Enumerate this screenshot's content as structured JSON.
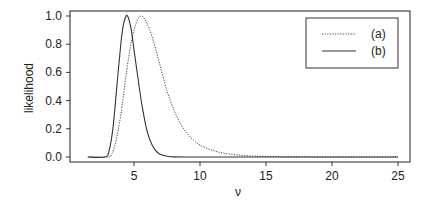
{
  "chart_data": {
    "type": "line",
    "title": "",
    "xlabel": "ν",
    "ylabel": "likelihood",
    "xlim": [
      0.7,
      25.9
    ],
    "ylim": [
      -0.04,
      1.04
    ],
    "xticks": [
      5,
      10,
      15,
      20,
      25
    ],
    "xtick_labels": [
      "5",
      "10",
      "15",
      "20",
      "25"
    ],
    "yticks": [
      0.0,
      0.2,
      0.4,
      0.6,
      0.8,
      1.0
    ],
    "ytick_labels": [
      "0.0",
      "0.2",
      "0.4",
      "0.6",
      "0.8",
      "1.0"
    ],
    "grid": false,
    "legend_position": "upper right",
    "series": [
      {
        "name": "(a)",
        "style": "dotted",
        "x": [
          1.5,
          3.0,
          3.3,
          3.6,
          4.0,
          4.4,
          4.8,
          5.2,
          5.5,
          5.8,
          6.2,
          6.6,
          7.0,
          7.5,
          8.0,
          8.5,
          9.0,
          9.5,
          10.0,
          11.0,
          12.0,
          13.0,
          14.0,
          15.0,
          16.0,
          18.0,
          20.0,
          22.0,
          25.0
        ],
        "values": [
          0.0,
          0.0,
          0.02,
          0.1,
          0.3,
          0.58,
          0.82,
          0.96,
          1.0,
          0.98,
          0.9,
          0.78,
          0.64,
          0.47,
          0.34,
          0.24,
          0.17,
          0.12,
          0.085,
          0.045,
          0.024,
          0.013,
          0.007,
          0.004,
          0.002,
          0.001,
          0.0,
          0.0,
          0.0
        ]
      },
      {
        "name": "(b)",
        "style": "solid",
        "x": [
          1.5,
          2.8,
          3.1,
          3.4,
          3.7,
          4.0,
          4.2,
          4.4,
          4.5,
          4.6,
          4.8,
          5.0,
          5.3,
          5.6,
          6.0,
          6.4,
          6.8,
          7.2,
          7.6,
          8.0,
          9.0,
          10.0,
          15.0,
          20.0,
          25.0
        ],
        "values": [
          0.0,
          0.0,
          0.04,
          0.2,
          0.5,
          0.8,
          0.94,
          1.0,
          1.0,
          0.98,
          0.9,
          0.76,
          0.56,
          0.37,
          0.18,
          0.08,
          0.03,
          0.012,
          0.004,
          0.001,
          0.0,
          0.0,
          0.0,
          0.0,
          0.0
        ]
      }
    ]
  },
  "legend": {
    "items": [
      {
        "label": "(a)",
        "style": "dotted"
      },
      {
        "label": "(b)",
        "style": "solid"
      }
    ]
  },
  "axes": {
    "xlabel": "ν",
    "ylabel": "likelihood"
  }
}
